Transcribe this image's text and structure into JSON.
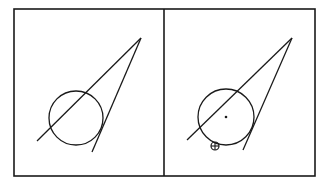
{
  "diagram": {
    "stroke_color": "#1a1a1a",
    "background": "#ffffff",
    "frame": {
      "x": 14,
      "y": 9,
      "width": 301,
      "height": 167,
      "divider_x": 164
    },
    "panels": [
      {
        "id": "left",
        "circle": {
          "cx": 76,
          "cy": 118,
          "r": 27
        },
        "lines": [
          {
            "x1": 141,
            "y1": 38,
            "x2": 37,
            "y2": 141
          },
          {
            "x1": 141,
            "y1": 38,
            "x2": 92,
            "y2": 152
          }
        ],
        "center_dot": null,
        "crosshair_marker": null
      },
      {
        "id": "right",
        "circle": {
          "cx": 226,
          "cy": 117,
          "r": 28
        },
        "lines": [
          {
            "x1": 292,
            "y1": 38,
            "x2": 187,
            "y2": 140
          },
          {
            "x1": 292,
            "y1": 38,
            "x2": 243,
            "y2": 150
          }
        ],
        "center_dot": {
          "cx": 226,
          "cy": 117,
          "r": 1.3
        },
        "crosshair_marker": {
          "cx": 215,
          "cy": 146,
          "r": 4
        }
      }
    ]
  }
}
